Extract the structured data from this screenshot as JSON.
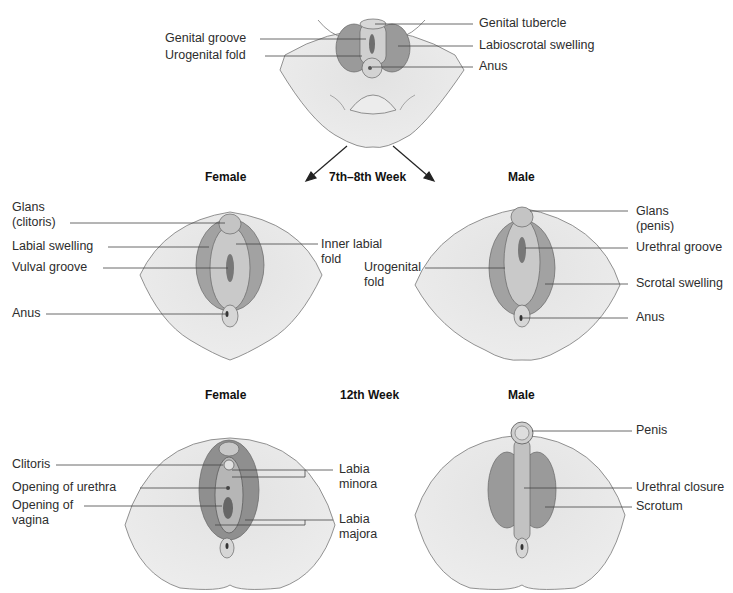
{
  "stages": {
    "indifferent": {
      "labels": [
        "Genital groove",
        "Urogenital fold",
        "Genital tubercle",
        "Labioscrotal swelling",
        "Anus"
      ]
    },
    "week_7_8": {
      "heading": "7th–8th Week",
      "female": {
        "heading": "Female",
        "labels": [
          "Glans\n(clitoris)",
          "Labial swelling",
          "Vulval groove",
          "Anus",
          "Inner labial\nfold"
        ]
      },
      "male": {
        "heading": "Male",
        "labels": [
          "Urogenital\nfold",
          "Glans\n(penis)",
          "Urethral groove",
          "Scrotal swelling",
          "Anus"
        ]
      }
    },
    "week_12": {
      "heading": "12th Week",
      "female": {
        "heading": "Female",
        "labels": [
          "Clitoris",
          "Opening of urethra",
          "Opening of\nvagina",
          "Labia\nminora",
          "Labia\nmajora"
        ]
      },
      "male": {
        "heading": "Male",
        "labels": [
          "Penis",
          "Urethral closure",
          "Scrotum"
        ]
      }
    }
  },
  "colors": {
    "skin": "#e6e6e6",
    "light_tissue": "#cfcfcf",
    "mid_tissue": "#a8a8a8",
    "dark_tissue": "#7a7a7a",
    "outline": "#555555",
    "leader_line": "#444444"
  }
}
